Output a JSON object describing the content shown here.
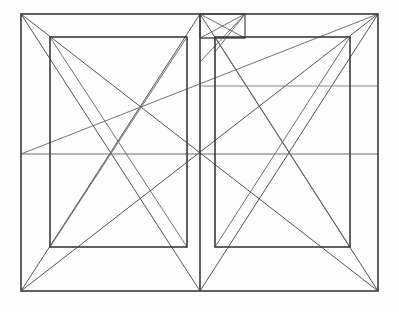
{
  "document": {
    "title": "Page Layout Canon Construction",
    "kind": "geometric-construction-diagram",
    "description": "Two-page book spread with harmonious text-block canon and construction diagonals"
  },
  "canvas": {
    "width": 399,
    "height": 312,
    "background_color": "#fdfdfd"
  },
  "style": {
    "frame_stroke_color": "#3a3a3a",
    "diagonal_stroke_color": "#555555",
    "guide_stroke_color": "#6d6d6d",
    "frame_stroke_width": 1.6,
    "diagonal_stroke_width": 1.0,
    "guide_stroke_width": 1.0
  },
  "geometry": {
    "outer_spread": {
      "name": "outer-page-spread-rectangle",
      "x1": 21,
      "y1": 14,
      "x2": 378,
      "y2": 291,
      "width": 357,
      "height": 277
    },
    "spine": {
      "name": "spine-gutter-line",
      "x": 200,
      "y1": 14,
      "y2": 291
    },
    "verso_text_block": {
      "name": "left-page-text-block",
      "x1": 50,
      "y1": 37,
      "x2": 187,
      "y2": 247,
      "width": 137,
      "height": 210
    },
    "recto_text_block": {
      "name": "right-page-text-block",
      "x1": 215,
      "y1": 37,
      "x2": 350,
      "y2": 247,
      "width": 135,
      "height": 210
    },
    "small_module_rect": {
      "name": "upper-center-module-rectangle",
      "x1": 200,
      "y1": 14,
      "x2": 245,
      "y2": 38,
      "width": 45,
      "height": 24
    },
    "guide_horizontals": [
      {
        "name": "full-width-guide-line",
        "y": 154,
        "x1": 21,
        "x2": 378
      },
      {
        "name": "right-page-guide-line",
        "y": 86,
        "x1": 200,
        "x2": 378
      },
      {
        "name": "module-guide-line",
        "y": 38,
        "x1": 200,
        "x2": 245
      }
    ],
    "key_nodes": [
      {
        "name": "spread-center-node",
        "x": 200,
        "y": 154
      },
      {
        "name": "verso-block-center-node",
        "x": 141,
        "y": 122
      },
      {
        "name": "module-corner-node",
        "x": 215,
        "y": 37
      }
    ],
    "diagonals": [
      {
        "name": "verso-page-diagonal-down",
        "x1": 21,
        "y1": 14,
        "x2": 200,
        "y2": 291
      },
      {
        "name": "verso-page-diagonal-up",
        "x1": 21,
        "y1": 291,
        "x2": 200,
        "y2": 14
      },
      {
        "name": "recto-page-diagonal-down",
        "x1": 200,
        "y1": 14,
        "x2": 378,
        "y2": 291
      },
      {
        "name": "recto-page-diagonal-up",
        "x1": 200,
        "y1": 291,
        "x2": 378,
        "y2": 14
      },
      {
        "name": "spread-diagonal-down",
        "x1": 21,
        "y1": 14,
        "x2": 378,
        "y2": 291
      },
      {
        "name": "spread-diagonal-up",
        "x1": 21,
        "y1": 291,
        "x2": 378,
        "y2": 14
      },
      {
        "name": "verso-block-diagonal-down",
        "x1": 50,
        "y1": 37,
        "x2": 187,
        "y2": 247
      },
      {
        "name": "verso-block-diagonal-up",
        "x1": 50,
        "y1": 247,
        "x2": 187,
        "y2": 37
      },
      {
        "name": "recto-block-diagonal-down",
        "x1": 215,
        "y1": 37,
        "x2": 350,
        "y2": 247
      },
      {
        "name": "recto-block-diagonal-up",
        "x1": 215,
        "y1": 247,
        "x2": 350,
        "y2": 37
      },
      {
        "name": "long-guide-diagonal-left",
        "x1": 21,
        "y1": 154,
        "x2": 378,
        "y2": 14
      },
      {
        "name": "module-diagonal-down",
        "x1": 200,
        "y1": 14,
        "x2": 245,
        "y2": 38
      },
      {
        "name": "module-diagonal-up",
        "x1": 200,
        "y1": 38,
        "x2": 245,
        "y2": 14
      },
      {
        "name": "module-to-recto-corner",
        "x1": 245,
        "y1": 14,
        "x2": 215,
        "y2": 52
      },
      {
        "name": "module-corner-to-center",
        "x1": 245,
        "y1": 14,
        "x2": 200,
        "y2": 62
      }
    ]
  }
}
